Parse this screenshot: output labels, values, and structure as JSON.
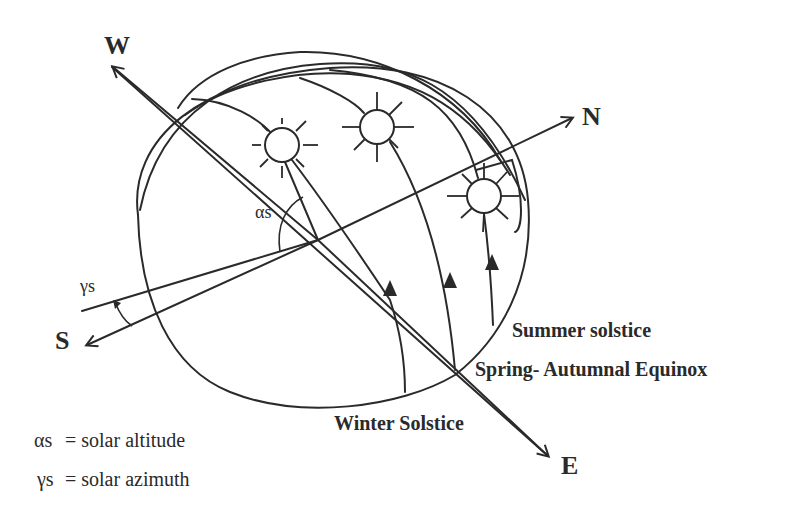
{
  "diagram": {
    "type": "solar path diagram",
    "directions": {
      "west": "W",
      "north": "N",
      "south": "S",
      "east": "E"
    },
    "angle_labels": {
      "altitude": "αs",
      "azimuth": "γs"
    },
    "path_labels": {
      "summer": "Summer solstice",
      "equinox": "Spring- Autumnal Equinox",
      "winter": "Winter Solstice"
    },
    "legend": [
      {
        "symbol": "αs",
        "text": "= solar altitude"
      },
      {
        "symbol": "γs",
        "text": "= solar azimuth"
      }
    ],
    "suns": [
      {
        "name": "winter-sun",
        "cx": 282,
        "cy": 145,
        "r": 17
      },
      {
        "name": "equinox-sun",
        "cx": 377,
        "cy": 127,
        "r": 17
      },
      {
        "name": "summer-sun",
        "cx": 484,
        "cy": 196,
        "r": 17
      }
    ],
    "colors": {
      "ink": "#2a2a2a",
      "background": "#ffffff"
    }
  }
}
